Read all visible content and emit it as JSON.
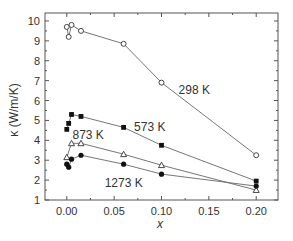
{
  "chart_data": {
    "type": "line",
    "title": "",
    "xlabel": "x",
    "ylabel": "κ (W/m/K)",
    "xlim": [
      -0.023,
      0.223
    ],
    "ylim": [
      1,
      10.4
    ],
    "xticks": [
      0.0,
      0.05,
      0.1,
      0.15,
      0.2
    ],
    "xtick_labels": [
      "0.00",
      "0.05",
      "0.10",
      "0.15",
      "0.20"
    ],
    "yticks": [
      1,
      2,
      3,
      4,
      5,
      6,
      7,
      8,
      9,
      10
    ],
    "ytick_labels": [
      "1",
      "2",
      "3",
      "4",
      "5",
      "6",
      "7",
      "8",
      "9",
      "10"
    ],
    "grid": false,
    "legend": "inline labels",
    "series": [
      {
        "name": "298 K",
        "marker": "open-circle",
        "x": [
          0.0,
          0.002,
          0.005,
          0.015,
          0.06,
          0.1,
          0.2
        ],
        "values": [
          9.7,
          9.2,
          9.8,
          9.5,
          8.85,
          6.9,
          3.25
        ],
        "label_pos": [
          0.118,
          6.35
        ]
      },
      {
        "name": "573 K",
        "marker": "filled-square",
        "x": [
          0.0,
          0.002,
          0.005,
          0.015,
          0.06,
          0.1,
          0.2
        ],
        "values": [
          4.55,
          4.85,
          5.3,
          5.2,
          4.65,
          3.75,
          1.95
        ],
        "label_pos": [
          0.071,
          4.45
        ]
      },
      {
        "name": "873 K",
        "marker": "open-triangle",
        "x": [
          0.0,
          0.005,
          0.015,
          0.06,
          0.1,
          0.2
        ],
        "values": [
          3.15,
          3.85,
          3.85,
          3.3,
          2.75,
          1.5
        ],
        "label_pos": [
          0.006,
          4.05
        ]
      },
      {
        "name": "1273 K",
        "marker": "filled-circle",
        "x": [
          0.0,
          0.002,
          0.005,
          0.015,
          0.06,
          0.1,
          0.2
        ],
        "values": [
          2.8,
          2.65,
          3.05,
          3.25,
          2.8,
          2.3,
          1.7
        ],
        "label_pos": [
          0.04,
          1.65
        ]
      }
    ]
  },
  "labels": {
    "xlabel": "x",
    "ylabel": "κ (W/m/K)"
  }
}
